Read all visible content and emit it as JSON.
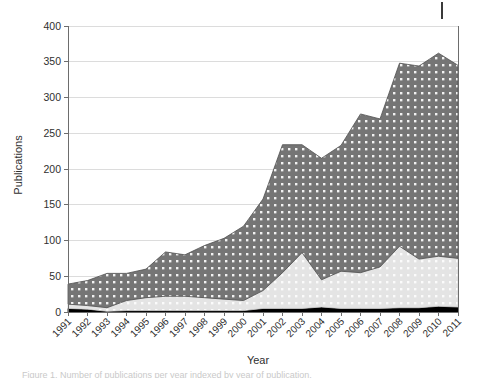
{
  "chart_data": {
    "type": "area",
    "title": "",
    "subtitle": "",
    "xlabel": "Year",
    "ylabel": "Publications",
    "stacked": true,
    "grid": true,
    "legend_position": "none",
    "xlim": [
      1991,
      2011
    ],
    "ylim": [
      0,
      400
    ],
    "ytick_step": 50,
    "yticks": [
      0,
      50,
      100,
      150,
      200,
      250,
      300,
      350,
      400
    ],
    "ytick_labels": [
      "0",
      "50",
      "100",
      "150",
      "200",
      "250",
      "300",
      "350",
      "400"
    ],
    "categories": [
      1991,
      1992,
      1993,
      1994,
      1995,
      1996,
      1997,
      1998,
      1999,
      2000,
      2001,
      2002,
      2003,
      2004,
      2005,
      2006,
      2007,
      2008,
      2009,
      2010,
      2011
    ],
    "xtick_labels": [
      "1991",
      "1992",
      "1993",
      "1994",
      "1995",
      "1996",
      "1997",
      "1998",
      "1999",
      "2000",
      "2001",
      "2002",
      "2003",
      "2004",
      "2005",
      "2006",
      "2007",
      "2008",
      "2009",
      "2010",
      "2011"
    ],
    "xtick_rotation": 45,
    "series": [
      {
        "name": "series-black",
        "color": "#000000",
        "pattern": "solid",
        "values": [
          5,
          4,
          1,
          2,
          2,
          2,
          2,
          2,
          2,
          2,
          5,
          5,
          5,
          7,
          5,
          5,
          5,
          6,
          6,
          8,
          7
        ]
      },
      {
        "name": "series-light-gray",
        "color": "#e4e4e4",
        "pattern": "dotted-light",
        "values": [
          6,
          5,
          5,
          14,
          18,
          20,
          20,
          18,
          16,
          14,
          25,
          50,
          78,
          38,
          52,
          50,
          58,
          86,
          68,
          70,
          68
        ]
      },
      {
        "name": "series-dark-gray",
        "color": "#757575",
        "pattern": "dotted-dark",
        "values": [
          28,
          35,
          48,
          38,
          40,
          62,
          58,
          73,
          85,
          104,
          128,
          179,
          151,
          170,
          176,
          222,
          207,
          256,
          270,
          284,
          270
        ]
      }
    ],
    "totals": [
      39,
      44,
      54,
      54,
      60,
      84,
      80,
      93,
      103,
      120,
      158,
      234,
      234,
      215,
      233,
      277,
      270,
      348,
      344,
      362,
      345
    ]
  },
  "axis": {
    "y_title": "Publications",
    "x_title": "Year"
  },
  "caption": {
    "cropped_text": "Figure 1. Number of publications per year indexed by year of publication."
  }
}
